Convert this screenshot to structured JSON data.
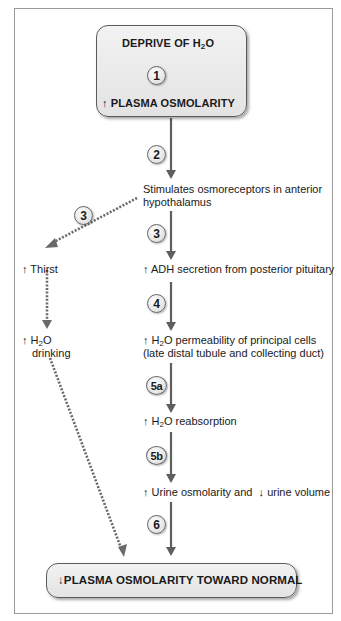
{
  "diagram": {
    "top_box": {
      "line1": "DEPRIVE OF H",
      "line1_sub": "2",
      "line1_tail": "O",
      "line2_arrow": "↑",
      "line2": "PLASMA OSMOLARITY"
    },
    "bottom_box": {
      "arrow": "↓",
      "label": "PLASMA OSMOLARITY TOWARD NORMAL"
    },
    "steps": [
      {
        "id": "1",
        "label": "1"
      },
      {
        "id": "2",
        "label": "2"
      },
      {
        "id": "3-left",
        "label": "3"
      },
      {
        "id": "3-right",
        "label": "3"
      },
      {
        "id": "4",
        "label": "4"
      },
      {
        "id": "5a",
        "label": "5a"
      },
      {
        "id": "5b",
        "label": "5b"
      },
      {
        "id": "6",
        "label": "6"
      }
    ],
    "main_path": {
      "osmoreceptors": {
        "line1": "Stimulates osmoreceptors in anterior",
        "line2": "hypothalamus"
      },
      "adh": {
        "arrow": "↑",
        "text": "ADH secretion from posterior pituitary"
      },
      "permeability": {
        "arrow": "↑",
        "pre": "H",
        "sub": "2",
        "post": "O permeability of principal cells",
        "line2": "(late distal tubule and collecting duct)"
      },
      "reabsorption": {
        "arrow": "↑",
        "pre": "H",
        "sub": "2",
        "post": "O reabsorption"
      },
      "urine": {
        "arrow1": "↑",
        "text1": "Urine osmolarity and",
        "arrow2": "↓",
        "text2": "urine volume"
      }
    },
    "side_path": {
      "thirst": {
        "arrow": "↑",
        "text": "Thirst"
      },
      "drinking": {
        "arrow": "↑",
        "pre": "H",
        "sub": "2",
        "post": "O",
        "line2": "drinking"
      }
    },
    "colors": {
      "arrow": "#5f5f5f",
      "dotted_arrow": "#6a6a6a",
      "box_fill": "#e8e8e8",
      "border": "#5a5a5a"
    }
  }
}
